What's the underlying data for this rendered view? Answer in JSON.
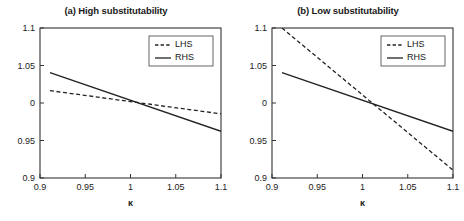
{
  "figure": {
    "width": 464,
    "height": 221,
    "background": "#ffffff",
    "line_color": "#222222",
    "axis_color": "#333333"
  },
  "chart_data": [
    {
      "type": "line",
      "panel_id": "a",
      "title": "(a) High substitutability",
      "xlabel": "κ",
      "ylabel": "",
      "xlim": [
        0.9,
        1.1
      ],
      "ylim": [
        0.9,
        1.1
      ],
      "xticks": [
        0.9,
        0.95,
        1,
        1.05,
        1.1
      ],
      "xticklabels": [
        "0.9",
        "0.95",
        "1",
        "1.05",
        "1.1"
      ],
      "yticks": [
        0.9,
        0.95,
        1,
        1.05,
        1.1
      ],
      "yticklabels": [
        "0.9",
        "0.95",
        "0",
        "1.05",
        "1.1"
      ],
      "grid": false,
      "legend_position": "upper right",
      "series": [
        {
          "name": "LHS",
          "style": "dashed",
          "x": [
            0.911,
            1.1
          ],
          "values": [
            1.0165,
            0.9855
          ]
        },
        {
          "name": "RHS",
          "style": "solid",
          "x": [
            0.911,
            1.1
          ],
          "values": [
            1.0405,
            0.9623
          ]
        }
      ],
      "intersection": {
        "x": 1.0,
        "y": 1.0
      }
    },
    {
      "type": "line",
      "panel_id": "b",
      "title": "(b) Low substitutability",
      "xlabel": "κ",
      "ylabel": "",
      "xlim": [
        0.9,
        1.1
      ],
      "ylim": [
        0.9,
        1.1
      ],
      "xticks": [
        0.9,
        0.95,
        1,
        1.05,
        1.1
      ],
      "xticklabels": [
        "0.9",
        "0.95",
        "1",
        "1.05",
        "1.1"
      ],
      "yticks": [
        0.9,
        0.95,
        1,
        1.05,
        1.1
      ],
      "yticklabels": [
        "0.9",
        "0.95",
        "0",
        "1.05",
        "1.1"
      ],
      "grid": false,
      "legend_position": "upper right",
      "series": [
        {
          "name": "LHS",
          "style": "dashed",
          "x": [
            0.911,
            1.1
          ],
          "values": [
            1.1,
            0.9105
          ]
        },
        {
          "name": "RHS",
          "style": "solid",
          "x": [
            0.911,
            1.1
          ],
          "values": [
            1.0405,
            0.9623
          ]
        }
      ],
      "intersection": {
        "x": 1.0,
        "y": 1.0
      }
    }
  ],
  "legend": {
    "entries": [
      {
        "label": "LHS",
        "style": "dashed"
      },
      {
        "label": "RHS",
        "style": "solid"
      }
    ]
  }
}
